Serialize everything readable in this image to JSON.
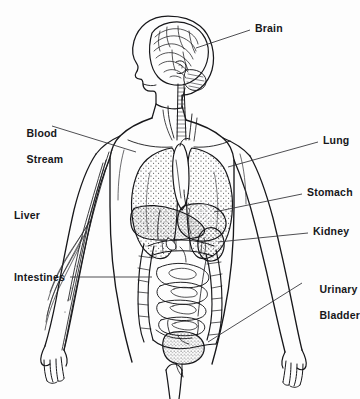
{
  "diagram": {
    "background_color": "#fdfdfd",
    "ink_color": "#17171a",
    "leader_color": "#3a3a3e",
    "labels": [
      {
        "id": "brain",
        "text": "Brain",
        "lines": [
          "Brain"
        ],
        "side": "right",
        "x": 255,
        "y": 22,
        "leader": {
          "from_x": 250,
          "from_y": 30,
          "to_x": 196,
          "to_y": 48
        }
      },
      {
        "id": "blood-stream",
        "text": "Blood Stream",
        "lines": [
          "Blood",
          "Stream"
        ],
        "side": "left",
        "x": 14,
        "y": 114,
        "leader": {
          "from_x": 52,
          "from_y": 126,
          "to_x": 136,
          "to_y": 152
        }
      },
      {
        "id": "lung",
        "text": "Lung",
        "lines": [
          "Lung"
        ],
        "side": "right",
        "x": 323,
        "y": 134,
        "leader": {
          "from_x": 318,
          "from_y": 142,
          "to_x": 228,
          "to_y": 167
        }
      },
      {
        "id": "stomach",
        "text": "Stomach",
        "lines": [
          "Stomach"
        ],
        "side": "right",
        "x": 307,
        "y": 186,
        "leader": {
          "from_x": 302,
          "from_y": 194,
          "to_x": 214,
          "to_y": 212
        }
      },
      {
        "id": "liver",
        "text": "Liver",
        "lines": [
          "Liver"
        ],
        "side": "left",
        "x": 14,
        "y": 209,
        "leader": null
      },
      {
        "id": "kidney",
        "text": "Kidney",
        "lines": [
          "Kidney"
        ],
        "side": "right",
        "x": 313,
        "y": 225,
        "leader": {
          "from_x": 308,
          "from_y": 233,
          "to_x": 218,
          "to_y": 242
        }
      },
      {
        "id": "intestines",
        "text": "Intestines",
        "lines": [
          "Intestines"
        ],
        "side": "left",
        "x": 14,
        "y": 271,
        "leader": {
          "from_x": 70,
          "from_y": 277,
          "to_x": 152,
          "to_y": 277
        }
      },
      {
        "id": "urinary-bladder",
        "text": "Urinary Bladder",
        "lines": [
          "Urinary",
          "Bladder"
        ],
        "side": "right",
        "x": 307,
        "y": 270,
        "leader": {
          "from_x": 302,
          "from_y": 283,
          "to_x": 208,
          "to_y": 342
        }
      }
    ],
    "organs": [
      {
        "id": "brain",
        "name": "brain",
        "region": "head",
        "rendering": "gyri-line-detail"
      },
      {
        "id": "trachea",
        "name": "trachea",
        "region": "neck",
        "rendering": "ribbed-tube"
      },
      {
        "id": "lung-left",
        "name": "lung",
        "region": "thorax",
        "rendering": "stippled"
      },
      {
        "id": "lung-right",
        "name": "lung",
        "region": "thorax",
        "rendering": "stippled"
      },
      {
        "id": "heart",
        "name": "heart",
        "region": "thorax",
        "rendering": "outline"
      },
      {
        "id": "liver",
        "name": "liver",
        "region": "abdomen",
        "rendering": "stippled"
      },
      {
        "id": "stomach",
        "name": "stomach",
        "region": "abdomen",
        "rendering": "stippled"
      },
      {
        "id": "kidney",
        "name": "kidney",
        "region": "abdomen",
        "rendering": "stippled"
      },
      {
        "id": "small-intestine",
        "name": "small intestine",
        "region": "abdomen",
        "rendering": "coiled-outline"
      },
      {
        "id": "large-intestine",
        "name": "large intestine",
        "region": "abdomen",
        "rendering": "haustra-outline"
      },
      {
        "id": "urinary-bladder",
        "name": "urinary bladder",
        "region": "pelvis",
        "rendering": "stippled"
      },
      {
        "id": "blood-vessels-arm",
        "name": "blood vessels",
        "region": "left-arm",
        "rendering": "paired-lines"
      }
    ]
  }
}
